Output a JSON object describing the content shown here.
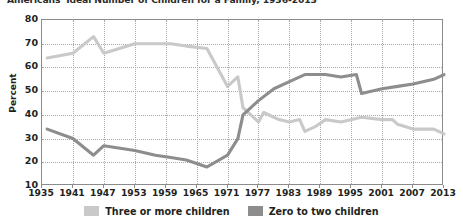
{
  "chart_data": {
    "type": "line",
    "title": "Americans' Ideal Number of Children for a Family, 1936-2013",
    "xlabel": "",
    "ylabel": "Percent",
    "ylim": [
      10,
      80
    ],
    "xlim": [
      1935,
      2013
    ],
    "y_ticks": [
      80,
      70,
      60,
      50,
      40,
      30,
      20,
      10
    ],
    "x_ticks": [
      1935,
      1941,
      1947,
      1953,
      1959,
      1965,
      1971,
      1977,
      1983,
      1989,
      1995,
      2001,
      2007,
      2013
    ],
    "grid": true,
    "legend_position": "bottom",
    "colors": {
      "three_or_more": "#c9c9c9",
      "zero_to_two": "#8d8d8d",
      "axis": "#8b8b8b",
      "grid": "#a9a9a9",
      "text": "#231f20"
    },
    "series": [
      {
        "name": "Three or more children",
        "color": "#c9c9c9",
        "x": [
          1936,
          1941,
          1945,
          1947,
          1953,
          1957,
          1960,
          1963,
          1967,
          1971,
          1973,
          1974,
          1977,
          1978,
          1980,
          1981,
          1983,
          1985,
          1986,
          1988,
          1990,
          1993,
          1997,
          2001,
          2003,
          2004,
          2007,
          2011,
          2013
        ],
        "values": [
          64,
          66,
          73,
          66,
          70,
          70,
          70,
          69,
          68,
          52,
          56,
          43,
          37,
          41,
          39,
          38,
          37,
          38,
          33,
          35,
          38,
          37,
          39,
          38,
          38,
          36,
          34,
          34,
          32
        ]
      },
      {
        "name": "Zero to two children",
        "color": "#8d8d8d",
        "x": [
          1936,
          1941,
          1945,
          1947,
          1953,
          1957,
          1960,
          1963,
          1967,
          1971,
          1973,
          1974,
          1977,
          1980,
          1983,
          1986,
          1988,
          1990,
          1993,
          1996,
          1997,
          2001,
          2004,
          2007,
          2011,
          2013
        ],
        "values": [
          34,
          30,
          23,
          27,
          25,
          23,
          22,
          21,
          18,
          23,
          30,
          40,
          46,
          51,
          54,
          57,
          57,
          57,
          56,
          57,
          49,
          51,
          52,
          53,
          55,
          57
        ]
      }
    ],
    "legend": [
      {
        "label": "Three or more children",
        "color": "#c9c9c9"
      },
      {
        "label": "Zero to two children",
        "color": "#8d8d8d"
      }
    ]
  }
}
